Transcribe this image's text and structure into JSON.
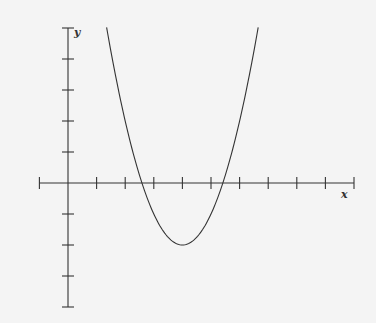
{
  "chart_data": {
    "type": "line",
    "title": "",
    "xlabel": "x",
    "ylabel": "y",
    "function": "y = (x - 4)^2 - 2",
    "xlim": [
      -1,
      10
    ],
    "ylim": [
      -4,
      5
    ],
    "x_ticks": [
      1,
      2,
      3,
      4,
      5,
      6,
      7,
      8,
      9,
      10
    ],
    "y_ticks": [
      -4,
      -3,
      -2,
      -1,
      1,
      2,
      3,
      4,
      5
    ],
    "tick_labels_shown": false,
    "grid": false,
    "legend": null,
    "series": [
      {
        "name": "parabola",
        "vertex": [
          4,
          -2
        ],
        "roots": [
          2.59,
          5.41
        ],
        "x": [
          1.35,
          2,
          2.59,
          3,
          3.5,
          4,
          4.5,
          5,
          5.41,
          6,
          6.65
        ],
        "y": [
          5,
          2,
          0,
          -1,
          -1.75,
          -2,
          -1.75,
          -1,
          0,
          2,
          5
        ]
      }
    ],
    "colors": {
      "line": "#333333",
      "axis": "#333333",
      "background": "#f4f4f4"
    }
  },
  "labels": {
    "x": "x",
    "y": "y"
  }
}
